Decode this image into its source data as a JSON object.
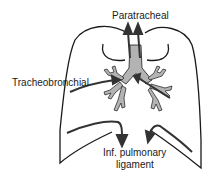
{
  "diagram": {
    "labels": {
      "top": "Paratracheal",
      "left": "Tracheobronchial",
      "bottom_line1": "Inf. pulmonary",
      "bottom_line2": "ligament"
    },
    "colors": {
      "outline": "#1a1a1a",
      "airway_fill": "#b3b3b3",
      "arrow": "#333333",
      "background": "#ffffff"
    }
  }
}
